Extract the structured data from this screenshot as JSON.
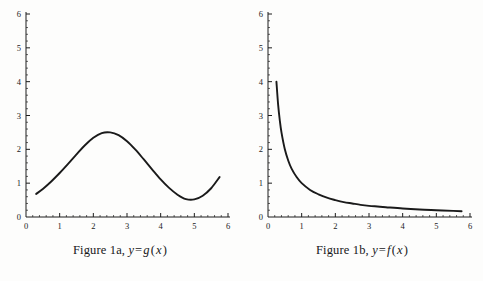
{
  "page": {
    "background_color": "#fdfdfc",
    "ink_color": "#17171a"
  },
  "figures": [
    {
      "id": "figure-1a",
      "caption_prefix": "Figure 1a,",
      "caption_lhs": "y",
      "caption_op": "=",
      "caption_rhs_fn": "g",
      "caption_rhs_arg": "x",
      "caption_full": "Figure 1a, y = g(x)"
    },
    {
      "id": "figure-1b",
      "caption_prefix": "Figure 1b,",
      "caption_lhs": "y",
      "caption_op": "=",
      "caption_rhs_fn": "f",
      "caption_rhs_arg": "x",
      "caption_full": "Figure 1b, y = f(x)"
    }
  ],
  "chart_data": [
    {
      "type": "line",
      "title": "Figure 1a, y = g(x)",
      "xlabel": "",
      "ylabel": "",
      "xlim": [
        0,
        6
      ],
      "ylim": [
        0,
        6
      ],
      "xticks": [
        0,
        1,
        2,
        3,
        4,
        5,
        6
      ],
      "xticklabels": [
        "0",
        "1",
        "2",
        "3",
        "4",
        "5",
        "6"
      ],
      "yticks": [
        0,
        1,
        2,
        3,
        4,
        5,
        6
      ],
      "yticklabels": [
        "0",
        "1",
        "2",
        "3",
        "4",
        "5",
        "6"
      ],
      "minor_ticks_per_interval": 5,
      "grid": false,
      "legend": false,
      "line_color": "#1a1a1a",
      "line_width": 1.9,
      "domain": [
        0.3,
        5.75
      ],
      "annotations": [
        "local maximum approximately (2.25, 2.5)",
        "local minimum approximately (4.75, 0.5)",
        "left endpoint approximately (0.3, 0.7)",
        "right endpoint approximately (5.75, 1.2)"
      ],
      "x": [
        0.3,
        0.5,
        0.75,
        1.0,
        1.25,
        1.5,
        1.75,
        2.0,
        2.25,
        2.5,
        2.75,
        3.0,
        3.25,
        3.5,
        3.75,
        4.0,
        4.25,
        4.5,
        4.75,
        5.0,
        5.25,
        5.5,
        5.75
      ],
      "y": [
        0.68,
        0.83,
        1.05,
        1.3,
        1.57,
        1.85,
        2.12,
        2.34,
        2.48,
        2.5,
        2.42,
        2.24,
        1.99,
        1.7,
        1.4,
        1.11,
        0.86,
        0.66,
        0.53,
        0.52,
        0.63,
        0.85,
        1.18
      ]
    },
    {
      "type": "line",
      "title": "Figure 1b, y = f(x)",
      "xlabel": "",
      "ylabel": "",
      "xlim": [
        0,
        6
      ],
      "ylim": [
        0,
        6
      ],
      "xticks": [
        0,
        1,
        2,
        3,
        4,
        5,
        6
      ],
      "xticklabels": [
        "0",
        "1",
        "2",
        "3",
        "4",
        "5",
        "6"
      ],
      "yticks": [
        0,
        1,
        2,
        3,
        4,
        5,
        6
      ],
      "yticklabels": [
        "0",
        "1",
        "2",
        "3",
        "4",
        "5",
        "6"
      ],
      "minor_ticks_per_interval": 5,
      "grid": false,
      "legend": false,
      "line_color": "#1a1a1a",
      "line_width": 1.9,
      "domain": [
        0.25,
        5.75
      ],
      "annotations": [
        "left endpoint approximately (0.25, 4.0)",
        "passes through approximately (1, 1.0)",
        "passes through approximately (2, 0.5)",
        "right endpoint approximately (5.75, 0.17)",
        "decreasing hyperbolic decay, asymptotic to y = 0"
      ],
      "x": [
        0.25,
        0.3,
        0.35,
        0.4,
        0.5,
        0.6,
        0.7,
        0.85,
        1.0,
        1.25,
        1.5,
        1.75,
        2.0,
        2.25,
        2.5,
        2.75,
        3.0,
        3.25,
        3.5,
        4.0,
        4.5,
        5.0,
        5.5,
        5.75
      ],
      "y": [
        4.0,
        3.33,
        2.86,
        2.5,
        2.0,
        1.67,
        1.43,
        1.18,
        1.0,
        0.8,
        0.67,
        0.57,
        0.5,
        0.44,
        0.4,
        0.36,
        0.33,
        0.31,
        0.29,
        0.25,
        0.22,
        0.2,
        0.18,
        0.17
      ]
    }
  ]
}
